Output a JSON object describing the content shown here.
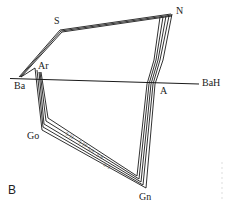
{
  "figure": {
    "panel_label": "B",
    "landmarks": {
      "S": "S",
      "N": "N",
      "Ar": "Ar",
      "Ba": "Ba",
      "A": "A",
      "BaH": "BaH",
      "Go": "Go",
      "Gn": "Gn"
    },
    "tracing_labels": [
      "5-11",
      "5-10",
      "5-9",
      "5-8",
      "0-3"
    ],
    "colors": {
      "line": "#1a1a1a",
      "background": "#ffffff"
    }
  }
}
